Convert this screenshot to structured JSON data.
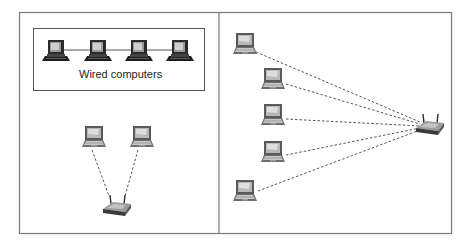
{
  "figure": {
    "left_panel": {
      "wired_group_label": "Wired computers",
      "wired_computers": 4,
      "wireless_laptops": 2,
      "router": "wireless-router"
    },
    "right_panel": {
      "wireless_laptops": 5,
      "router": "wireless-router"
    },
    "colors": {
      "border": "#7a7a7a",
      "link_dashed": "#555555",
      "link_wired": "#555555",
      "device_dark": "#2b2b2b",
      "device_mid": "#8a8a8a",
      "device_light": "#d8d8d8"
    }
  }
}
